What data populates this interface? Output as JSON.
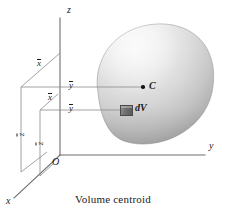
{
  "figure": {
    "caption": "Volume centroid",
    "axes": {
      "z_label": "z",
      "y_label": "y",
      "x_label": "x",
      "origin_label": "O"
    },
    "points": {
      "centroid_label": "C",
      "element_label": "dV"
    },
    "dimensions": {
      "x_bar_upper": "x",
      "y_bar_upper": "y",
      "z_bar_outer": "z",
      "x_bar_lower": "x",
      "y_bar_lower": "y",
      "z_bar_inner": "z",
      "overbar": true
    },
    "colors": {
      "line": "#6e6e6e",
      "text": "#1a1a1a",
      "blob_light": "#f4f4f4",
      "blob_mid": "#d8d8d8",
      "blob_dark": "#b3b3b3",
      "element_fill": "#6f6f6f",
      "background": "#ffffff"
    }
  }
}
